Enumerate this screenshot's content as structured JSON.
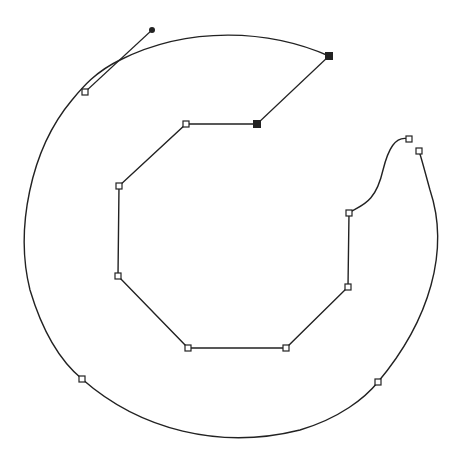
{
  "canvas": {
    "width": 464,
    "height": 456,
    "background": "#ffffff",
    "stroke": "#222222"
  },
  "outer_path": {
    "d": "M 329 56 C 270 30, 190 25, 120 60 C 95 72, 82 88, 72 100 C 30 150, 15 230, 30 290 C 45 340, 65 365, 82 379 C 140 430, 220 450, 300 430 C 340 418, 365 398, 378 382 C 430 320, 450 250, 430 190 C 425 172, 422 160, 419 151",
    "inner_curve_d": "M 409 139 C 395 135, 388 150, 383 170 C 375 205, 360 205, 349 213"
  },
  "inner_polygon": {
    "points": [
      [
        257,
        124
      ],
      [
        186,
        124
      ],
      [
        119,
        186
      ],
      [
        118,
        276
      ],
      [
        188,
        348
      ],
      [
        286,
        348
      ],
      [
        348,
        287
      ],
      [
        349,
        213
      ]
    ]
  },
  "closing_line": {
    "x1": 257,
    "y1": 124,
    "x2": 329,
    "y2": 56
  },
  "handle_line": {
    "x1": 85,
    "y1": 92,
    "x2": 152,
    "y2": 30
  },
  "anchors_open": [
    [
      85,
      92
    ],
    [
      186,
      124
    ],
    [
      119,
      186
    ],
    [
      118,
      276
    ],
    [
      188,
      348
    ],
    [
      286,
      348
    ],
    [
      348,
      287
    ],
    [
      349,
      213
    ],
    [
      409,
      139
    ],
    [
      419,
      151
    ],
    [
      378,
      382
    ],
    [
      82,
      379
    ]
  ],
  "anchors_filled": [
    [
      329,
      56
    ],
    [
      257,
      124
    ]
  ],
  "control_points": [
    [
      152,
      30
    ]
  ]
}
